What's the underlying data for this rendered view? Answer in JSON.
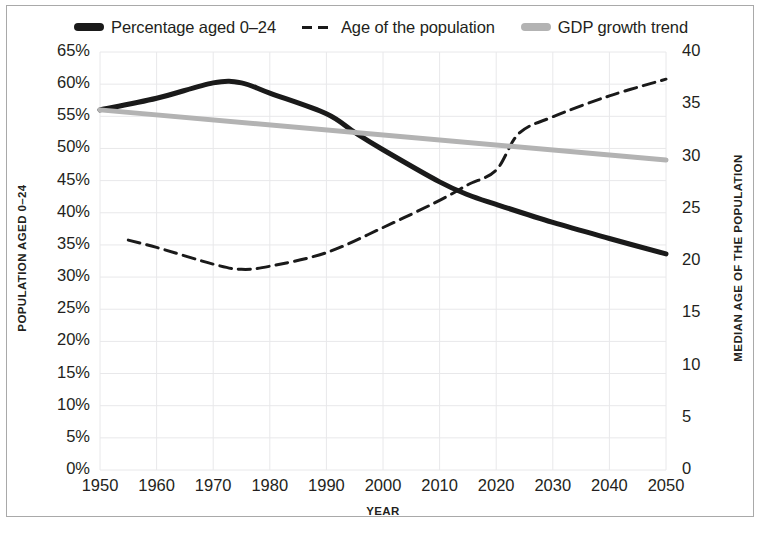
{
  "chart_data": {
    "type": "line",
    "title": "",
    "xlabel": "YEAR",
    "ylabel": "POPULATION AGED 0–24",
    "y2label": "MEDIAN AGE OF THE POPULATION",
    "grid": true,
    "legend_position": "top-center",
    "xlim": [
      1950,
      2050
    ],
    "ylim": [
      0,
      65
    ],
    "y2lim": [
      0,
      40
    ],
    "xticks": [
      1950,
      1960,
      1970,
      1980,
      1990,
      2000,
      2010,
      2020,
      2030,
      2040,
      2050
    ],
    "xtick_labels": [
      "1950",
      "1960",
      "1970",
      "1980",
      "1990",
      "2000",
      "2010",
      "2020",
      "2030",
      "2040",
      "2050"
    ],
    "yticks": [
      0,
      5,
      10,
      15,
      20,
      25,
      30,
      35,
      40,
      45,
      50,
      55,
      60,
      65
    ],
    "ytick_labels": [
      "0%",
      "5%",
      "10%",
      "15%",
      "20%",
      "25%",
      "30%",
      "35%",
      "40%",
      "45%",
      "50%",
      "55%",
      "60%",
      "65%"
    ],
    "y2ticks": [
      0,
      5,
      10,
      15,
      20,
      25,
      30,
      35,
      40
    ],
    "y2tick_labels": [
      "0",
      "5",
      "10",
      "15",
      "20",
      "25",
      "30",
      "35",
      "40"
    ],
    "series": [
      {
        "name": "Percentage aged 0–24",
        "axis": "left",
        "style": "solid",
        "color": "#1a1a1a",
        "width": 5,
        "x": [
          1950,
          1960,
          1970,
          1975,
          1980,
          1990,
          1995,
          2000,
          2010,
          2015,
          2020,
          2030,
          2040,
          2050
        ],
        "values": [
          56.0,
          57.8,
          60.2,
          60.2,
          58.6,
          55.4,
          52.5,
          49.8,
          44.8,
          42.8,
          41.3,
          38.5,
          36.0,
          33.6
        ]
      },
      {
        "name": "Age of the population",
        "axis": "right",
        "style": "dashed",
        "color": "#1a1a1a",
        "width": 3,
        "x": [
          1955,
          1960,
          1970,
          1975,
          1980,
          1990,
          2000,
          2010,
          2015,
          2020,
          2024,
          2030,
          2040,
          2050
        ],
        "values": [
          22.0,
          21.3,
          19.7,
          19.2,
          19.5,
          20.8,
          23.2,
          25.8,
          27.3,
          28.7,
          32.2,
          33.8,
          35.8,
          37.4
        ]
      },
      {
        "name": "GDP growth trend",
        "axis": "left",
        "style": "solid",
        "color": "#b3b3b3",
        "width": 5,
        "x": [
          1950,
          2050
        ],
        "values": [
          56.0,
          48.2
        ]
      }
    ]
  },
  "legend": {
    "items": [
      {
        "label": "Percentage aged 0–24",
        "swatch": "solid-dark-swatch"
      },
      {
        "label": "Age of the population",
        "swatch": "dashed-dark-swatch"
      },
      {
        "label": "GDP growth trend",
        "swatch": "solid-gray-swatch"
      }
    ]
  },
  "colors": {
    "line_dark": "#1a1a1a",
    "line_gray": "#b3b3b3",
    "grid": "#e8e8ea",
    "text": "#231f20",
    "frame": "#a9a9a9"
  }
}
